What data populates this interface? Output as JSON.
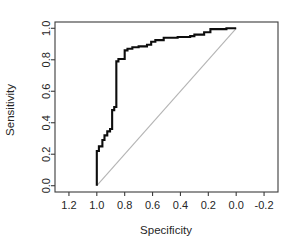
{
  "figure": {
    "name": "roc-curve-plot",
    "background_color": "#ffffff",
    "curve_color": "#0d0d0d",
    "diagonal_color": "#b4b4b4",
    "axis_color": "#3b3b3b"
  },
  "chart_data": {
    "type": "line",
    "title": "",
    "subtitle": "",
    "xlabel": "Specificity",
    "ylabel": "Sensitivity",
    "xlim": [
      1.3,
      -0.3
    ],
    "ylim": [
      -0.04,
      1.04
    ],
    "x_reversed": true,
    "grid": false,
    "legend": null,
    "legend_position": "none",
    "xticks": [
      1.2,
      1.0,
      0.8,
      0.6,
      0.4,
      0.2,
      0.0,
      -0.2
    ],
    "xtick_labels": [
      "1.2",
      "1.0",
      "0.8",
      "0.6",
      "0.4",
      "0.2",
      "0.0",
      "-0.2"
    ],
    "yticks": [
      0.0,
      0.2,
      0.4,
      0.6,
      0.8,
      1.0
    ],
    "ytick_labels": [
      "0.0",
      "0.2",
      "0.4",
      "0.6",
      "0.8",
      "1.0"
    ],
    "series": [
      {
        "name": "ROC curve",
        "color": "#0d0d0d",
        "linewidth": 2.1,
        "style": "step",
        "x": [
          1.0,
          1.0,
          0.985,
          0.985,
          0.96,
          0.96,
          0.945,
          0.945,
          0.925,
          0.925,
          0.905,
          0.905,
          0.89,
          0.89,
          0.875,
          0.875,
          0.86,
          0.86,
          0.845,
          0.845,
          0.8,
          0.8,
          0.78,
          0.78,
          0.745,
          0.745,
          0.7,
          0.7,
          0.64,
          0.64,
          0.61,
          0.61,
          0.58,
          0.58,
          0.52,
          0.52,
          0.42,
          0.42,
          0.33,
          0.33,
          0.3,
          0.3,
          0.23,
          0.23,
          0.185,
          0.185,
          0.07,
          0.07,
          0.0
        ],
        "y": [
          0.0,
          0.22,
          0.22,
          0.25,
          0.25,
          0.29,
          0.29,
          0.32,
          0.32,
          0.345,
          0.345,
          0.36,
          0.36,
          0.48,
          0.48,
          0.5,
          0.5,
          0.79,
          0.79,
          0.805,
          0.805,
          0.86,
          0.86,
          0.87,
          0.87,
          0.88,
          0.88,
          0.885,
          0.885,
          0.895,
          0.895,
          0.915,
          0.915,
          0.925,
          0.925,
          0.94,
          0.94,
          0.945,
          0.945,
          0.95,
          0.95,
          0.96,
          0.96,
          0.975,
          0.975,
          0.995,
          0.995,
          1.0,
          1.0
        ]
      },
      {
        "name": "reference diagonal",
        "color": "#b4b4b4",
        "linewidth": 1.1,
        "style": "line",
        "x": [
          1.0,
          0.0
        ],
        "y": [
          0.0,
          1.0
        ]
      }
    ]
  },
  "axes": {
    "x_axis_title": "Specificity",
    "y_axis_title": "Sensitivity"
  }
}
